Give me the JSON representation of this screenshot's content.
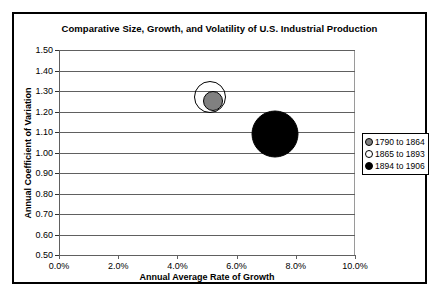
{
  "chart_data": {
    "type": "scatter",
    "title": "Comparative Size, Growth, and Volatility of U.S. Industrial Production",
    "xlabel": "Annual Average Rate of Growth",
    "ylabel": "Annual Coefficient of Variation",
    "xlim": [
      0.0,
      10.0
    ],
    "ylim": [
      0.5,
      1.5
    ],
    "xticks": [
      "0.0%",
      "2.0%",
      "4.0%",
      "6.0%",
      "8.0%",
      "10.0%"
    ],
    "xtick_values": [
      0.0,
      2.0,
      4.0,
      6.0,
      8.0,
      10.0
    ],
    "yticks": [
      "0.50",
      "0.60",
      "0.70",
      "0.80",
      "0.90",
      "1.00",
      "1.10",
      "1.20",
      "1.30",
      "1.40",
      "1.50"
    ],
    "ytick_values": [
      0.5,
      0.6,
      0.7,
      0.8,
      0.9,
      1.0,
      1.1,
      1.2,
      1.3,
      1.4,
      1.5
    ],
    "grid": "horizontal",
    "legend_position": "right",
    "series": [
      {
        "name": "1790 to 1864",
        "marker": "filled-circle",
        "color": "#808080",
        "x": 5.2,
        "y": 1.25,
        "bubble_diameter_px": 20
      },
      {
        "name": "1865 to 1893",
        "marker": "hollow-circle",
        "color": "#ffffff",
        "x": 5.1,
        "y": 1.27,
        "bubble_diameter_px": 32
      },
      {
        "name": "1894 to 1906",
        "marker": "filled-circle",
        "color": "#000000",
        "x": 7.3,
        "y": 1.09,
        "bubble_diameter_px": 47
      }
    ]
  }
}
